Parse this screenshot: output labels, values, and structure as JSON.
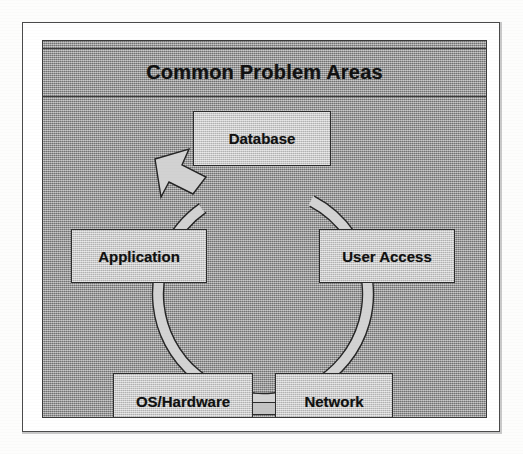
{
  "figure": {
    "title": "Common Problem Areas",
    "type": "cycle-diagram",
    "direction": "clockwise",
    "colors": {
      "panel_gray": "#9b9b9b",
      "box_fill": "#c9c9c9",
      "ring_fill": "#d0d0d0",
      "line": "#2c2c2c",
      "text": "#111111",
      "page": "#ffffff"
    }
  },
  "nodes": [
    {
      "id": "database",
      "label": "Database",
      "position": "top"
    },
    {
      "id": "user-access",
      "label": "User Access",
      "position": "right"
    },
    {
      "id": "network",
      "label": "Network",
      "position": "bottom-right"
    },
    {
      "id": "os-hardware",
      "label": "OS/Hardware",
      "position": "bottom-left"
    },
    {
      "id": "application",
      "label": "Application",
      "position": "left"
    }
  ],
  "arrow": {
    "name": "cycle-arrow",
    "points_to": "Database",
    "direction": "clockwise"
  }
}
